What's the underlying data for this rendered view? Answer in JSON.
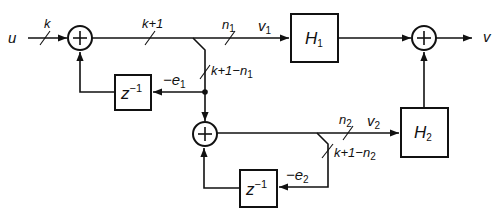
{
  "diagram": {
    "type": "block-diagram",
    "signals": {
      "input": "u",
      "output": "v",
      "v1": "v",
      "v1_sub": "1",
      "v2": "v",
      "v2_sub": "2",
      "e1_prefix": "−e",
      "e1_sub": "1",
      "e2_prefix": "−e",
      "e2_sub": "2"
    },
    "bus_widths": {
      "input": "k",
      "sum1_out": "k+1",
      "n1": "n",
      "n1_sub": "1",
      "n2": "n",
      "n2_sub": "2",
      "err1": "k+1−n",
      "err1_sub": "1",
      "err2": "k+1−n",
      "err2_sub": "2"
    },
    "blocks": {
      "h1": {
        "label": "H",
        "sub": "1"
      },
      "h2": {
        "label": "H",
        "sub": "2"
      },
      "delay1": {
        "label": "z",
        "sup": "−1"
      },
      "delay2": {
        "label": "z",
        "sup": "−1"
      }
    },
    "summers": {
      "sum1": "+",
      "sum2": "+",
      "sum3": "+"
    },
    "colors": {
      "line": "#111111",
      "background": "#ffffff"
    }
  }
}
